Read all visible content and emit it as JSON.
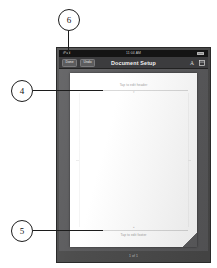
{
  "device": {
    "status_bar": {
      "carrier": "iPad",
      "time": "11:04 AM",
      "battery_label": "97%"
    },
    "page_indicator": "1 of 1"
  },
  "toolbar": {
    "done_label": "Done",
    "undo_label": "Undo",
    "title": "Document Setup",
    "icons": [
      {
        "name": "text-format-icon",
        "glyph": "A"
      },
      {
        "name": "layout-grid-icon",
        "glyph": "grid"
      }
    ]
  },
  "document": {
    "header": {
      "placeholder": "Tap to edit header",
      "caret": "▾"
    },
    "footer": {
      "placeholder": "Tap to edit footer",
      "caret": "▴"
    }
  },
  "callouts": [
    {
      "id": "callout-6",
      "number": "6"
    },
    {
      "id": "callout-4",
      "number": "4"
    },
    {
      "id": "callout-5",
      "number": "5"
    }
  ],
  "colors": {
    "bezel": "#4a4a4a",
    "toolbar": "#3c3c3e",
    "canvas": "#59595b",
    "page": "#ffffff",
    "status_bar": "#141414",
    "callout_stroke": "#1c1c1c"
  }
}
